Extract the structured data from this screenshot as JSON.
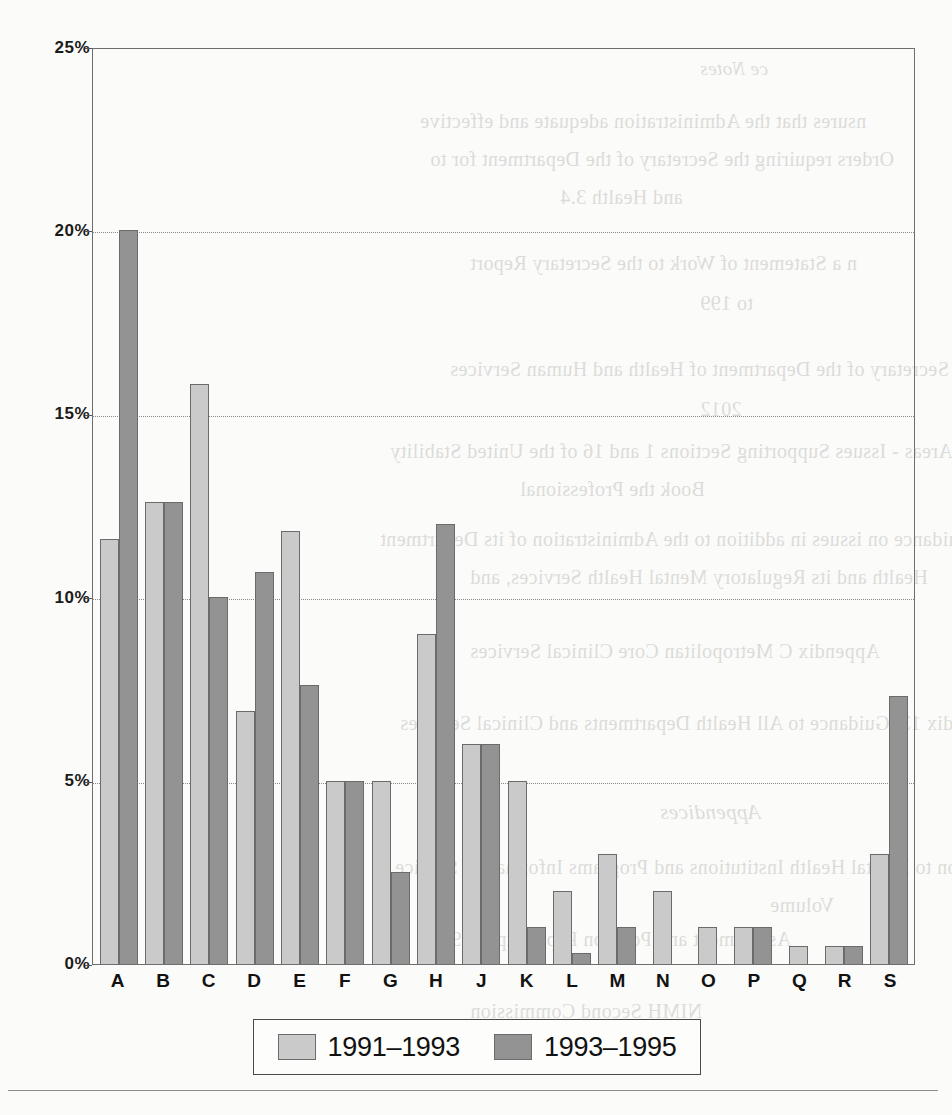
{
  "chart_data": {
    "type": "bar",
    "title": "",
    "subtitle": "",
    "xlabel": "",
    "ylabel": "",
    "ylim": [
      0,
      25
    ],
    "ytick_labels": [
      "0%",
      "5%",
      "10%",
      "15%",
      "20%",
      "25%"
    ],
    "ytick_values": [
      0,
      5,
      10,
      15,
      20,
      25
    ],
    "grid": "horizontal-dotted",
    "legend_position": "bottom-center",
    "categories": [
      "A",
      "B",
      "C",
      "D",
      "E",
      "F",
      "G",
      "H",
      "J",
      "K",
      "L",
      "M",
      "N",
      "O",
      "P",
      "Q",
      "R",
      "S"
    ],
    "series": [
      {
        "name": "1991–1993",
        "color": "#cacaca",
        "values": [
          11.6,
          12.6,
          15.8,
          6.9,
          11.8,
          5.0,
          5.0,
          9.0,
          6.0,
          5.0,
          2.0,
          3.0,
          2.0,
          1.0,
          1.0,
          0.5,
          0.5,
          3.0
        ]
      },
      {
        "name": "1993–1995",
        "color": "#939393",
        "values": [
          20.0,
          12.6,
          10.0,
          10.7,
          7.6,
          5.0,
          2.5,
          12.0,
          6.0,
          1.0,
          0.3,
          1.0,
          0.0,
          0.0,
          1.0,
          0.0,
          0.5,
          7.3
        ]
      }
    ]
  },
  "legend": {
    "items": [
      {
        "label": "1991–1993",
        "swatch": "light-gray-swatch"
      },
      {
        "label": "1993–1995",
        "swatch": "dark-gray-swatch"
      }
    ]
  },
  "ghost_text": {
    "lines": [
      "ce Notes",
      "nsures that the Administration adequate and effective",
      "Orders requiring the Secretary of the Department for to",
      "and Health 3.4",
      "n a Statement of Work to the Secretary Report",
      "to 199",
      "Secretary of the Department of Health and Human Services",
      "2012",
      "hic Areas - Issues Supporting Sections 1 and 16 of the United Stability",
      "Book the Professional",
      "ion Note 5. Guidance on issues in addition to the Administration of its Department",
      "Health and its Regulatory Mental Health Services, and",
      "Appendix C Metropolitan Core Clinical Services",
      "Appendix 13. Guidance to All Health Departments and Clinical Services",
      "Appendices",
      "ion to Mental Health Institutions and Programs Information Service",
      "Volume",
      "Assessment and Position Paper, April 1992",
      "NIMH Second Commission"
    ]
  }
}
